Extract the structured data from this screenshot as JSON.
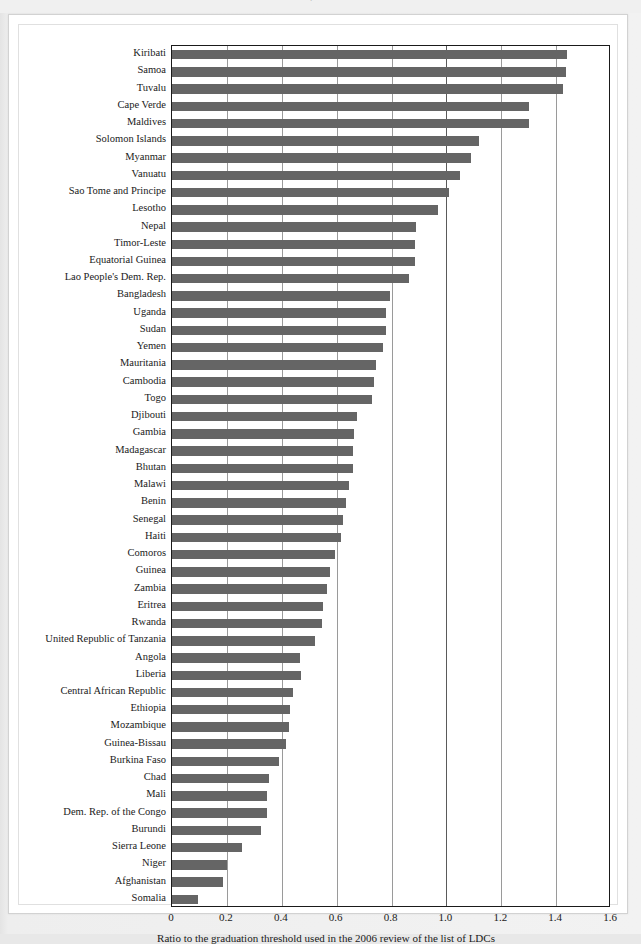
{
  "header": {
    "cut_text": "."
  },
  "chart_data": {
    "type": "bar",
    "orientation": "horizontal",
    "title": "",
    "xlabel": "Ratio to the graduation threshold used in the 2006 review of the list of LDCs",
    "ylabel": "",
    "xlim": [
      0,
      1.6
    ],
    "xticks": [
      "0",
      "0.2",
      "0.4",
      "0.6",
      "0.8",
      "1.0",
      "1.2",
      "1.4",
      "1.6"
    ],
    "xtick_values": [
      0,
      0.2,
      0.4,
      0.6,
      0.8,
      1.0,
      1.2,
      1.4,
      1.6
    ],
    "grid": true,
    "legend": "none",
    "bar_color": "#656565",
    "axis_color": "#1a1a1a",
    "gridline_color": "#9a9a9a",
    "categories": [
      "Kiribati",
      "Samoa",
      "Tuvalu",
      "Cape Verde",
      "Maldives",
      "Solomon Islands",
      "Myanmar",
      "Vanuatu",
      "Sao Tome and Principe",
      "Lesotho",
      "Nepal",
      "Timor-Leste",
      "Equatorial Guinea",
      "Lao People's Dem. Rep.",
      "Bangladesh",
      "Uganda",
      "Sudan",
      "Yemen",
      "Mauritania",
      "Cambodia",
      "Togo",
      "Djibouti",
      "Gambia",
      "Madagascar",
      "Bhutan",
      "Malawi",
      "Benin",
      "Senegal",
      "Haiti",
      "Comoros",
      "Guinea",
      "Zambia",
      "Eritrea",
      "Rwanda",
      "United Republic of Tanzania",
      "Angola",
      "Liberia",
      "Central African Republic",
      "Ethiopia",
      "Mozambique",
      "Guinea-Bissau",
      "Burkina Faso",
      "Chad",
      "Mali",
      "Dem. Rep. of the Congo",
      "Burundi",
      "Sierra Leone",
      "Niger",
      "Afghanistan",
      "Somalia"
    ],
    "values": [
      1.44,
      1.435,
      1.425,
      1.3,
      1.3,
      1.12,
      1.09,
      1.05,
      1.01,
      0.97,
      0.89,
      0.885,
      0.885,
      0.865,
      0.795,
      0.78,
      0.78,
      0.77,
      0.745,
      0.735,
      0.73,
      0.675,
      0.665,
      0.66,
      0.66,
      0.645,
      0.635,
      0.625,
      0.615,
      0.595,
      0.575,
      0.565,
      0.55,
      0.545,
      0.52,
      0.465,
      0.47,
      0.44,
      0.43,
      0.425,
      0.415,
      0.39,
      0.355,
      0.345,
      0.345,
      0.325,
      0.255,
      0.2,
      0.185,
      0.095
    ]
  }
}
